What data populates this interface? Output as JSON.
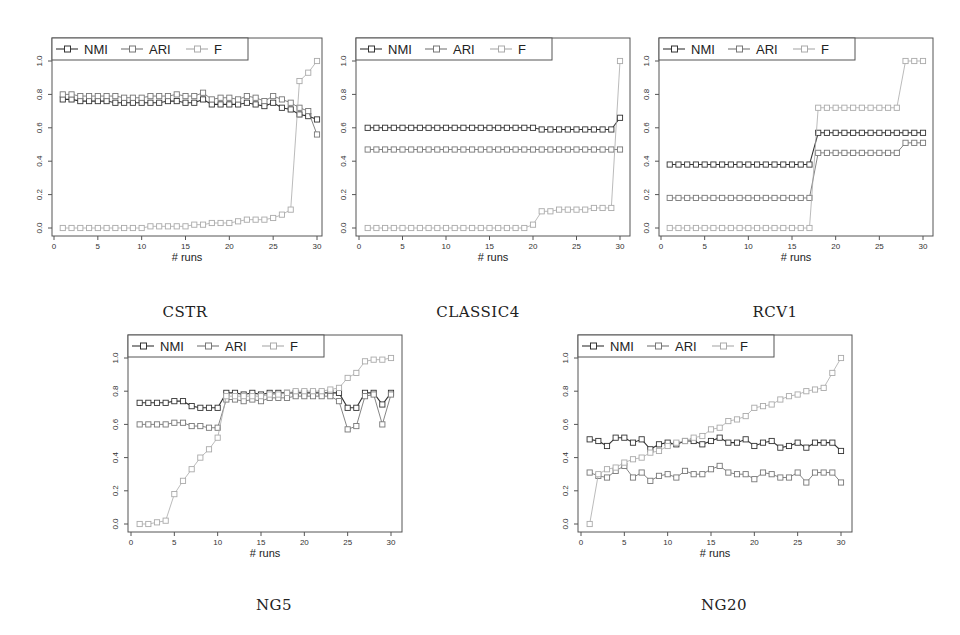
{
  "figure": {
    "captions": [
      "CSTR",
      "CLASSIC4",
      "RCV1",
      "NG5",
      "NG20"
    ]
  },
  "chart_data": [
    {
      "type": "line",
      "title": "CSTR",
      "xlabel": "# runs",
      "ylabel": "",
      "xlim": [
        0,
        30
      ],
      "ylim": [
        0,
        1.0
      ],
      "xticks": [
        0,
        5,
        10,
        15,
        20,
        25,
        30
      ],
      "yticks": [
        0.0,
        0.2,
        0.4,
        0.6,
        0.8,
        1.0
      ],
      "legend": [
        "NMI",
        "ARI",
        "F"
      ],
      "legend_position": "top-left",
      "x": [
        1,
        2,
        3,
        4,
        5,
        6,
        7,
        8,
        9,
        10,
        11,
        12,
        13,
        14,
        15,
        16,
        17,
        18,
        19,
        20,
        21,
        22,
        23,
        24,
        25,
        26,
        27,
        28,
        29,
        30
      ],
      "series": [
        {
          "name": "NMI",
          "color": "#333333",
          "values": [
            0.77,
            0.77,
            0.76,
            0.76,
            0.76,
            0.76,
            0.75,
            0.75,
            0.75,
            0.75,
            0.75,
            0.75,
            0.76,
            0.76,
            0.75,
            0.75,
            0.77,
            0.74,
            0.74,
            0.74,
            0.74,
            0.75,
            0.74,
            0.73,
            0.75,
            0.72,
            0.71,
            0.68,
            0.67,
            0.65
          ]
        },
        {
          "name": "ARI",
          "color": "#777777",
          "values": [
            0.8,
            0.8,
            0.79,
            0.79,
            0.79,
            0.79,
            0.79,
            0.78,
            0.78,
            0.78,
            0.79,
            0.79,
            0.79,
            0.8,
            0.79,
            0.79,
            0.81,
            0.77,
            0.78,
            0.78,
            0.77,
            0.79,
            0.78,
            0.76,
            0.79,
            0.77,
            0.75,
            0.72,
            0.7,
            0.56
          ]
        },
        {
          "name": "F",
          "color": "#aaaaaa",
          "values": [
            0.0,
            0.0,
            0.0,
            0.0,
            0.0,
            0.0,
            0.0,
            0.0,
            0.0,
            0.0,
            0.01,
            0.01,
            0.01,
            0.01,
            0.01,
            0.02,
            0.02,
            0.03,
            0.03,
            0.03,
            0.04,
            0.05,
            0.05,
            0.05,
            0.06,
            0.08,
            0.11,
            0.88,
            0.93,
            1.0
          ]
        }
      ]
    },
    {
      "type": "line",
      "title": "CLASSIC4",
      "xlabel": "# runs",
      "ylabel": "",
      "xlim": [
        0,
        30
      ],
      "ylim": [
        0,
        1.0
      ],
      "xticks": [
        0,
        5,
        10,
        15,
        20,
        25,
        30
      ],
      "yticks": [
        0.0,
        0.2,
        0.4,
        0.6,
        0.8,
        1.0
      ],
      "legend": [
        "NMI",
        "ARI",
        "F"
      ],
      "legend_position": "top-left",
      "x": [
        1,
        2,
        3,
        4,
        5,
        6,
        7,
        8,
        9,
        10,
        11,
        12,
        13,
        14,
        15,
        16,
        17,
        18,
        19,
        20,
        21,
        22,
        23,
        24,
        25,
        26,
        27,
        28,
        29,
        30
      ],
      "series": [
        {
          "name": "NMI",
          "color": "#333333",
          "values": [
            0.6,
            0.6,
            0.6,
            0.6,
            0.6,
            0.6,
            0.6,
            0.6,
            0.6,
            0.6,
            0.6,
            0.6,
            0.6,
            0.6,
            0.6,
            0.6,
            0.6,
            0.6,
            0.6,
            0.6,
            0.59,
            0.59,
            0.59,
            0.59,
            0.59,
            0.59,
            0.59,
            0.59,
            0.59,
            0.66
          ]
        },
        {
          "name": "ARI",
          "color": "#777777",
          "values": [
            0.47,
            0.47,
            0.47,
            0.47,
            0.47,
            0.47,
            0.47,
            0.47,
            0.47,
            0.47,
            0.47,
            0.47,
            0.47,
            0.47,
            0.47,
            0.47,
            0.47,
            0.47,
            0.47,
            0.47,
            0.47,
            0.47,
            0.47,
            0.47,
            0.47,
            0.47,
            0.47,
            0.47,
            0.47,
            0.47
          ]
        },
        {
          "name": "F",
          "color": "#aaaaaa",
          "values": [
            0.0,
            0.0,
            0.0,
            0.0,
            0.0,
            0.0,
            0.0,
            0.0,
            0.0,
            0.0,
            0.0,
            0.0,
            0.0,
            0.0,
            0.0,
            0.0,
            0.0,
            0.0,
            0.0,
            0.02,
            0.1,
            0.1,
            0.11,
            0.11,
            0.11,
            0.11,
            0.12,
            0.12,
            0.12,
            1.0
          ]
        }
      ]
    },
    {
      "type": "line",
      "title": "RCV1",
      "xlabel": "# runs",
      "ylabel": "",
      "xlim": [
        0,
        30
      ],
      "ylim": [
        0,
        1.0
      ],
      "xticks": [
        0,
        5,
        10,
        15,
        20,
        25,
        30
      ],
      "yticks": [
        0.0,
        0.2,
        0.4,
        0.6,
        0.8,
        1.0
      ],
      "legend": [
        "NMI",
        "ARI",
        "F"
      ],
      "legend_position": "top-left",
      "x": [
        1,
        2,
        3,
        4,
        5,
        6,
        7,
        8,
        9,
        10,
        11,
        12,
        13,
        14,
        15,
        16,
        17,
        18,
        19,
        20,
        21,
        22,
        23,
        24,
        25,
        26,
        27,
        28,
        29,
        30
      ],
      "series": [
        {
          "name": "NMI",
          "color": "#333333",
          "values": [
            0.38,
            0.38,
            0.38,
            0.38,
            0.38,
            0.38,
            0.38,
            0.38,
            0.38,
            0.38,
            0.38,
            0.38,
            0.38,
            0.38,
            0.38,
            0.38,
            0.38,
            0.57,
            0.57,
            0.57,
            0.57,
            0.57,
            0.57,
            0.57,
            0.57,
            0.57,
            0.57,
            0.57,
            0.57,
            0.57
          ]
        },
        {
          "name": "ARI",
          "color": "#777777",
          "values": [
            0.18,
            0.18,
            0.18,
            0.18,
            0.18,
            0.18,
            0.18,
            0.18,
            0.18,
            0.18,
            0.18,
            0.18,
            0.18,
            0.18,
            0.18,
            0.18,
            0.18,
            0.45,
            0.45,
            0.45,
            0.45,
            0.45,
            0.45,
            0.45,
            0.45,
            0.45,
            0.45,
            0.51,
            0.51,
            0.51
          ]
        },
        {
          "name": "F",
          "color": "#aaaaaa",
          "values": [
            0.0,
            0.0,
            0.0,
            0.0,
            0.0,
            0.0,
            0.0,
            0.0,
            0.0,
            0.0,
            0.0,
            0.0,
            0.0,
            0.0,
            0.0,
            0.0,
            0.0,
            0.72,
            0.72,
            0.72,
            0.72,
            0.72,
            0.72,
            0.72,
            0.72,
            0.72,
            0.72,
            1.0,
            1.0,
            1.0
          ]
        }
      ]
    },
    {
      "type": "line",
      "title": "NG5",
      "xlabel": "# runs",
      "ylabel": "",
      "xlim": [
        0,
        30
      ],
      "ylim": [
        0,
        1.0
      ],
      "xticks": [
        0,
        5,
        10,
        15,
        20,
        25,
        30
      ],
      "yticks": [
        0.0,
        0.2,
        0.4,
        0.6,
        0.8,
        1.0
      ],
      "legend": [
        "NMI",
        "ARI",
        "F"
      ],
      "legend_position": "top-left",
      "x": [
        1,
        2,
        3,
        4,
        5,
        6,
        7,
        8,
        9,
        10,
        11,
        12,
        13,
        14,
        15,
        16,
        17,
        18,
        19,
        20,
        21,
        22,
        23,
        24,
        25,
        26,
        27,
        28,
        29,
        30
      ],
      "series": [
        {
          "name": "NMI",
          "color": "#333333",
          "values": [
            0.73,
            0.73,
            0.73,
            0.73,
            0.74,
            0.74,
            0.71,
            0.7,
            0.7,
            0.7,
            0.79,
            0.79,
            0.78,
            0.79,
            0.78,
            0.79,
            0.79,
            0.79,
            0.79,
            0.79,
            0.79,
            0.79,
            0.79,
            0.79,
            0.7,
            0.7,
            0.79,
            0.79,
            0.72,
            0.79
          ]
        },
        {
          "name": "ARI",
          "color": "#777777",
          "values": [
            0.6,
            0.6,
            0.6,
            0.6,
            0.61,
            0.61,
            0.59,
            0.59,
            0.58,
            0.58,
            0.75,
            0.75,
            0.74,
            0.75,
            0.74,
            0.76,
            0.76,
            0.76,
            0.77,
            0.77,
            0.77,
            0.77,
            0.77,
            0.74,
            0.57,
            0.59,
            0.77,
            0.78,
            0.6,
            0.78
          ]
        },
        {
          "name": "F",
          "color": "#aaaaaa",
          "values": [
            0.0,
            0.0,
            0.01,
            0.02,
            0.18,
            0.26,
            0.33,
            0.4,
            0.45,
            0.52,
            0.77,
            0.77,
            0.77,
            0.77,
            0.77,
            0.78,
            0.78,
            0.79,
            0.8,
            0.8,
            0.8,
            0.8,
            0.81,
            0.82,
            0.88,
            0.91,
            0.98,
            0.99,
            0.99,
            1.0
          ]
        }
      ]
    },
    {
      "type": "line",
      "title": "NG20",
      "xlabel": "# runs",
      "ylabel": "",
      "xlim": [
        0,
        30
      ],
      "ylim": [
        0,
        1.0
      ],
      "xticks": [
        0,
        5,
        10,
        15,
        20,
        25,
        30
      ],
      "yticks": [
        0.0,
        0.2,
        0.4,
        0.6,
        0.8,
        1.0
      ],
      "legend": [
        "NMI",
        "ARI",
        "F"
      ],
      "legend_position": "top-left",
      "x": [
        1,
        2,
        3,
        4,
        5,
        6,
        7,
        8,
        9,
        10,
        11,
        12,
        13,
        14,
        15,
        16,
        17,
        18,
        19,
        20,
        21,
        22,
        23,
        24,
        25,
        26,
        27,
        28,
        29,
        30
      ],
      "series": [
        {
          "name": "NMI",
          "color": "#333333",
          "values": [
            0.51,
            0.5,
            0.47,
            0.52,
            0.52,
            0.49,
            0.51,
            0.45,
            0.48,
            0.49,
            0.48,
            0.5,
            0.5,
            0.48,
            0.5,
            0.52,
            0.49,
            0.49,
            0.51,
            0.47,
            0.49,
            0.5,
            0.46,
            0.47,
            0.49,
            0.46,
            0.49,
            0.49,
            0.49,
            0.44
          ]
        },
        {
          "name": "ARI",
          "color": "#777777",
          "values": [
            0.31,
            0.29,
            0.28,
            0.32,
            0.35,
            0.28,
            0.31,
            0.26,
            0.29,
            0.3,
            0.28,
            0.32,
            0.3,
            0.3,
            0.33,
            0.35,
            0.31,
            0.3,
            0.3,
            0.27,
            0.31,
            0.3,
            0.28,
            0.28,
            0.31,
            0.25,
            0.31,
            0.31,
            0.31,
            0.25
          ]
        },
        {
          "name": "F",
          "color": "#aaaaaa",
          "values": [
            0.0,
            0.3,
            0.33,
            0.34,
            0.37,
            0.39,
            0.4,
            0.43,
            0.44,
            0.47,
            0.49,
            0.5,
            0.52,
            0.53,
            0.57,
            0.58,
            0.62,
            0.63,
            0.65,
            0.7,
            0.71,
            0.72,
            0.75,
            0.77,
            0.78,
            0.8,
            0.81,
            0.82,
            0.91,
            1.0
          ]
        }
      ]
    }
  ]
}
